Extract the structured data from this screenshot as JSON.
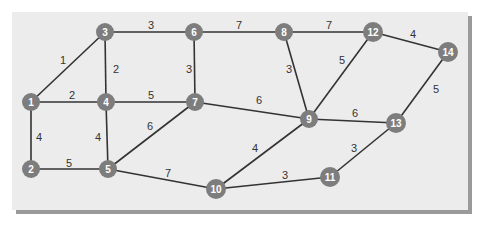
{
  "diagram": {
    "type": "weighted-undirected-graph",
    "colors": {
      "background": "#ececec",
      "shadow": "#9a9a9a",
      "node_fill": "#7d7d7d",
      "node_text": "#ffffff",
      "edge": "#333333",
      "weight_text": "#333333"
    },
    "nodes": [
      {
        "id": "1",
        "x": 31,
        "y": 102
      },
      {
        "id": "2",
        "x": 31,
        "y": 169
      },
      {
        "id": "3",
        "x": 105,
        "y": 32
      },
      {
        "id": "4",
        "x": 106,
        "y": 102
      },
      {
        "id": "5",
        "x": 108,
        "y": 169
      },
      {
        "id": "6",
        "x": 194,
        "y": 32
      },
      {
        "id": "7",
        "x": 195,
        "y": 102
      },
      {
        "id": "8",
        "x": 284,
        "y": 32
      },
      {
        "id": "9",
        "x": 309,
        "y": 119
      },
      {
        "id": "10",
        "x": 216,
        "y": 189
      },
      {
        "id": "11",
        "x": 330,
        "y": 177
      },
      {
        "id": "12",
        "x": 373,
        "y": 32
      },
      {
        "id": "13",
        "x": 396,
        "y": 123
      },
      {
        "id": "14",
        "x": 448,
        "y": 52
      }
    ],
    "edges": [
      {
        "from": "1",
        "to": "3",
        "weight": "1",
        "lx": 63,
        "ly": 60
      },
      {
        "from": "1",
        "to": "4",
        "weight": "2",
        "lx": 72,
        "ly": 95
      },
      {
        "from": "1",
        "to": "2",
        "weight": "4",
        "lx": 39,
        "ly": 137
      },
      {
        "from": "2",
        "to": "5",
        "weight": "5",
        "lx": 69,
        "ly": 163
      },
      {
        "from": "3",
        "to": "4",
        "weight": "2",
        "lx": 116,
        "ly": 69
      },
      {
        "from": "3",
        "to": "6",
        "weight": "3",
        "lx": 151,
        "ly": 25
      },
      {
        "from": "4",
        "to": "5",
        "weight": "4",
        "lx": 98,
        "ly": 137
      },
      {
        "from": "4",
        "to": "7",
        "weight": "5",
        "lx": 151,
        "ly": 95
      },
      {
        "from": "5",
        "to": "7",
        "weight": "6",
        "lx": 150,
        "ly": 126
      },
      {
        "from": "5",
        "to": "10",
        "weight": "7",
        "lx": 168,
        "ly": 173
      },
      {
        "from": "6",
        "to": "7",
        "weight": "3",
        "lx": 189,
        "ly": 69
      },
      {
        "from": "6",
        "to": "8",
        "weight": "7",
        "lx": 239,
        "ly": 25
      },
      {
        "from": "7",
        "to": "9",
        "weight": "6",
        "lx": 259,
        "ly": 100
      },
      {
        "from": "8",
        "to": "9",
        "weight": "3",
        "lx": 289,
        "ly": 69
      },
      {
        "from": "8",
        "to": "12",
        "weight": "7",
        "lx": 329,
        "ly": 25
      },
      {
        "from": "9",
        "to": "12",
        "weight": "5",
        "lx": 342,
        "ly": 60
      },
      {
        "from": "9",
        "to": "13",
        "weight": "6",
        "lx": 355,
        "ly": 113
      },
      {
        "from": "9",
        "to": "10",
        "weight": "4",
        "lx": 255,
        "ly": 148
      },
      {
        "from": "10",
        "to": "11",
        "weight": "3",
        "lx": 285,
        "ly": 175
      },
      {
        "from": "11",
        "to": "13",
        "weight": "3",
        "lx": 354,
        "ly": 148
      },
      {
        "from": "12",
        "to": "14",
        "weight": "4",
        "lx": 413,
        "ly": 34
      },
      {
        "from": "13",
        "to": "14",
        "weight": "5",
        "lx": 436,
        "ly": 89
      }
    ]
  }
}
